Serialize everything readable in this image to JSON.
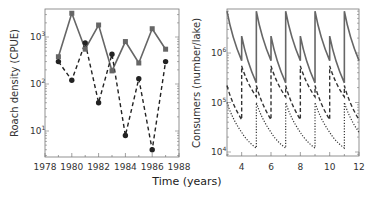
{
  "chart_data": [
    {
      "type": "line",
      "title": "",
      "xlabel": "",
      "ylabel": "Roach density (CPUE)",
      "yscale": "log",
      "xlim": [
        1978,
        1988
      ],
      "ylim": [
        3,
        4000
      ],
      "x_ticks": [
        "1978",
        "1980",
        "1982",
        "1984",
        "1986",
        "1988"
      ],
      "y_ticks": [
        "10^1",
        "10^2",
        "10^3"
      ],
      "grid": false,
      "x": [
        1979,
        1980,
        1981,
        1982,
        1983,
        1984,
        1985,
        1986,
        1987
      ],
      "series": [
        {
          "name": "solid-squares",
          "style": "solid",
          "marker": "square",
          "values": [
            380,
            3200,
            550,
            1800,
            190,
            800,
            280,
            1500,
            550
          ]
        },
        {
          "name": "dashed-circles",
          "style": "dashed",
          "marker": "circle",
          "values": [
            300,
            120,
            750,
            40,
            430,
            8,
            130,
            4,
            300
          ]
        }
      ]
    },
    {
      "type": "line",
      "title": "",
      "xlabel": "Time (years)",
      "ylabel": "Consumers (number/lake)",
      "yscale": "log",
      "xlim": [
        3,
        12
      ],
      "ylim": [
        9000,
        8000000
      ],
      "x_ticks": [
        "4",
        "6",
        "8",
        "10",
        "12"
      ],
      "y_ticks": [
        "10^4",
        "10^5",
        "10^6"
      ],
      "grid": false,
      "pattern": "sawtooth decay with biennial pulses",
      "series": [
        {
          "name": "solid",
          "style": "solid",
          "peaks": [
            [
              3,
              7000000
            ],
            [
              4,
              2200000
            ],
            [
              5,
              7000000
            ],
            [
              6,
              2200000
            ],
            [
              7,
              7000000
            ],
            [
              8,
              2200000
            ],
            [
              9,
              7000000
            ],
            [
              10,
              2200000
            ],
            [
              11,
              7000000
            ]
          ],
          "troughs": [
            [
              4,
              700000
            ],
            [
              5,
              250000
            ],
            [
              6,
              700000
            ],
            [
              7,
              250000
            ],
            [
              8,
              700000
            ],
            [
              9,
              250000
            ],
            [
              10,
              700000
            ],
            [
              11,
              250000
            ],
            [
              12,
              700000
            ]
          ]
        },
        {
          "name": "dashed",
          "style": "dashed",
          "peaks": [
            [
              3,
              220000
            ],
            [
              4,
              550000
            ],
            [
              5,
              220000
            ],
            [
              6,
              550000
            ],
            [
              7,
              220000
            ],
            [
              8,
              550000
            ],
            [
              9,
              220000
            ],
            [
              10,
              550000
            ],
            [
              11,
              220000
            ]
          ],
          "troughs": [
            [
              4,
              45000
            ],
            [
              5,
              130000
            ],
            [
              6,
              45000
            ],
            [
              7,
              130000
            ],
            [
              8,
              45000
            ],
            [
              9,
              130000
            ],
            [
              10,
              45000
            ],
            [
              11,
              130000
            ],
            [
              12,
              45000
            ]
          ]
        },
        {
          "name": "dotted",
          "style": "dotted",
          "peaks": [
            [
              3,
              100000
            ],
            [
              4,
              25000
            ],
            [
              5,
              100000
            ],
            [
              6,
              25000
            ],
            [
              7,
              100000
            ],
            [
              8,
              25000
            ],
            [
              9,
              100000
            ],
            [
              10,
              25000
            ],
            [
              11,
              100000
            ]
          ],
          "troughs": [
            [
              4,
              25000
            ],
            [
              5,
              12000
            ],
            [
              6,
              25000
            ],
            [
              7,
              12000
            ],
            [
              8,
              25000
            ],
            [
              9,
              12000
            ],
            [
              10,
              25000
            ],
            [
              11,
              12000
            ],
            [
              12,
              25000
            ]
          ]
        }
      ]
    }
  ],
  "labels": {
    "left_ylabel": "Roach density (CPUE)",
    "right_ylabel": "Consumers (number/lake)",
    "xlabel": "Time (years)",
    "left_xticks": [
      "1978",
      "1980",
      "1982",
      "1984",
      "1986",
      "1988"
    ],
    "right_xticks": [
      "4",
      "6",
      "8",
      "10",
      "12"
    ]
  }
}
